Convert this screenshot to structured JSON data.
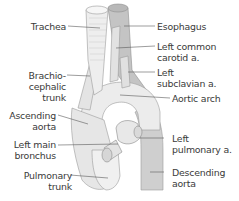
{
  "diagram": {
    "type": "anatomical-illustration",
    "colors": {
      "background": "#ffffff",
      "vessel_light": "#ebebeb",
      "vessel_mid": "#d6d6d6",
      "vessel_dark": "#bdbdbd",
      "outline": "#9a9a9a",
      "leader_line": "#5a5a5a",
      "text": "#3a3a3a"
    },
    "labels_left": {
      "trachea": "Trachea",
      "brachiocephalic_1": "Brachio-",
      "brachiocephalic_2": "cephalic",
      "brachiocephalic_3": "trunk",
      "ascending_1": "Ascending",
      "ascending_2": "aorta",
      "bronchus_1": "Left main",
      "bronchus_2": "bronchus",
      "pulmonary_trunk_1": "Pulmonary",
      "pulmonary_trunk_2": "trunk"
    },
    "labels_right": {
      "esophagus": "Esophagus",
      "left_common_carotid_1": "Left common",
      "left_common_carotid_2": "carotid a.",
      "left_subclavian_1": "Left",
      "left_subclavian_2": "subclavian a.",
      "aortic_arch": "Aortic arch",
      "left_pulmonary_1": "Left",
      "left_pulmonary_2": "pulmonary a.",
      "descending_1": "Descending",
      "descending_2": "aorta"
    }
  }
}
